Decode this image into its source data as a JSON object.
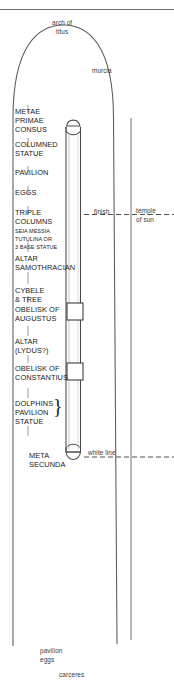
{
  "figure": {
    "line_color": "#555555",
    "text_color": "#1a1a1a"
  },
  "top_labels": {
    "arch_line1": "arch of",
    "arch_line2": "titus",
    "murcia": "murcia"
  },
  "right_labels": {
    "finish": "finish",
    "temple_line1": "temple",
    "temple_line2": "of sun",
    "white_line": "white line"
  },
  "bottom_labels": {
    "pavilion": "pavilion",
    "eggs": "eggs",
    "carceres": "carceres"
  },
  "spina_monuments": [
    {
      "id": "metae-primae-consus",
      "lines": [
        "METAE",
        "PRIMAE",
        "CONSUS"
      ],
      "size": "large"
    },
    {
      "id": "columned-statue",
      "lines": [
        "COLUMNED",
        "STATUE"
      ],
      "size": "large"
    },
    {
      "id": "pavilion",
      "lines": [
        "PAVILION"
      ],
      "size": "large"
    },
    {
      "id": "eggs",
      "lines": [
        "EGGS"
      ],
      "size": "large"
    },
    {
      "id": "triple-columns",
      "lines": [
        "TRIPLE",
        "COLUMNS"
      ],
      "size": "large"
    },
    {
      "id": "seia-messia-tutulina",
      "lines": [
        "SEIA MESSIA",
        "TUTULINA OR",
        "3 BASE STATUE"
      ],
      "size": "small"
    },
    {
      "id": "altar-samothracian",
      "lines": [
        "ALTAR",
        "SAMOTHRACIAN"
      ],
      "size": "large"
    },
    {
      "id": "cybele-tree",
      "lines": [
        "CYBELE",
        "& TREE"
      ],
      "size": "large"
    },
    {
      "id": "obelisk-of-augustus",
      "lines": [
        "OBELISK OF",
        "AUGUSTUS"
      ],
      "size": "large"
    },
    {
      "id": "altar-lydus",
      "lines": [
        "ALTAR",
        "(LYDUS?)"
      ],
      "size": "large"
    },
    {
      "id": "obelisk-of-constantius",
      "lines": [
        "OBELISK OF",
        "CONSTANTIUS"
      ],
      "size": "large"
    },
    {
      "id": "dolphins-pavilion-statue",
      "lines": [
        "DOLPHINS",
        "PAVILION",
        "STATUE"
      ],
      "size": "large"
    },
    {
      "id": "meta-secunda",
      "lines": [
        "META",
        "SECUNDA"
      ],
      "size": "large"
    }
  ],
  "label_text": {
    "metae": "METAE",
    "primae": "PRIMAE",
    "consus": "CONSUS",
    "columned": "COLUMNED",
    "statue": "STATUE",
    "pavilion_caps": "PAVILION",
    "eggs_caps": "EGGS",
    "triple": "TRIPLE",
    "columns": "COLUMNS",
    "seia": "SEIA MESSIA",
    "tutulina": "TUTULINA OR",
    "base_statue": "3 BASE STATUE",
    "altar": "ALTAR",
    "samothracian": "SAMOTHRACIAN",
    "cybele": "CYBELE",
    "and_tree": "& TREE",
    "obelisk_of_1": "OBELISK OF",
    "augustus": "AUGUSTUS",
    "altar2": "ALTAR",
    "lydus": "(LYDUS?)",
    "obelisk_of_2": "OBELISK OF",
    "constantius": "CONSTANTIUS",
    "dolphins": "DOLPHINS",
    "pavilion_caps2": "PAVILION",
    "statue2": "STATUE",
    "meta": "META",
    "secunda": "SECUNDA",
    "brace": "}"
  }
}
